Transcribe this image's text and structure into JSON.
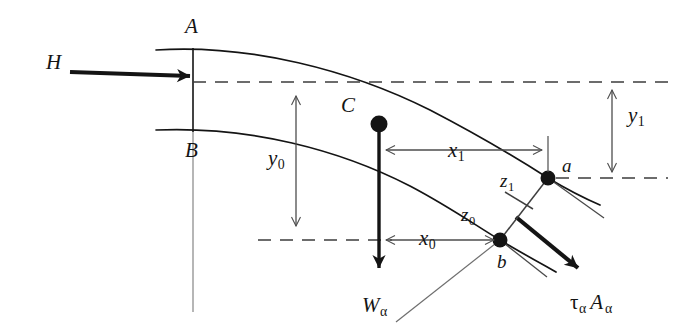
{
  "figure": {
    "type": "engineering-diagram",
    "background_color": "#ffffff",
    "line_color": "#141414",
    "thin_line_color": "#5a5a5a",
    "width": 686,
    "height": 330
  },
  "labels": {
    "H": {
      "text": "H",
      "x": 46,
      "y": 63
    },
    "A": {
      "text": "A",
      "x": 185,
      "y": 16
    },
    "B": {
      "text": "B",
      "x": 185,
      "y": 140
    },
    "C": {
      "text": "C",
      "x": 341,
      "y": 95
    },
    "a": {
      "text": "a",
      "x": 562,
      "y": 156
    },
    "b": {
      "text": "b",
      "x": 497,
      "y": 252
    }
  },
  "dimensions": {
    "y0": {
      "base": "y",
      "sub": "0",
      "x": 268,
      "y": 148,
      "from_y": 82,
      "to_y": 240,
      "at_x": 296
    },
    "y1": {
      "base": "y",
      "sub": "1",
      "x": 628,
      "y": 105,
      "from_y": 82,
      "to_y": 178,
      "at_x": 612
    },
    "x0": {
      "base": "x",
      "sub": "0",
      "x": 419,
      "y": 228,
      "from_x": 380,
      "to_x": 500,
      "at_y": 240
    },
    "x1": {
      "base": "x",
      "sub": "1",
      "x": 448,
      "y": 140,
      "from_x": 380,
      "to_x": 548,
      "at_y": 150
    },
    "z0": {
      "base": "z",
      "sub": "0",
      "x": 461,
      "y": 205
    },
    "z1": {
      "base": "z",
      "sub": "1",
      "x": 500,
      "y": 171
    }
  },
  "forces": {
    "H": {
      "text": "H",
      "description": "horizontal driving force",
      "x": 46,
      "y": 63
    },
    "W": {
      "base": "W",
      "sub": "α",
      "description": "weight of wedge",
      "x": 362,
      "y": 295
    },
    "tau": {
      "tau": "τ",
      "sub1": "α",
      "A": "A",
      "sub2": "α",
      "description": "shear resistance on failure plane",
      "x": 570,
      "y": 292
    }
  }
}
